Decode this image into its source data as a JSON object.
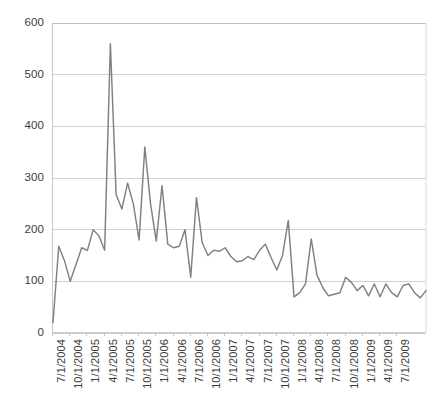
{
  "chart_data": {
    "type": "line",
    "title": "",
    "subtitle": "",
    "xlabel": "",
    "ylabel": "",
    "ylim": [
      0,
      600
    ],
    "ytick_step": 100,
    "yticks": [
      600,
      500,
      400,
      300,
      200,
      100,
      0
    ],
    "grid": true,
    "gridlines": "horizontal",
    "legend": false,
    "legend_position": "none",
    "series_color": "#808080",
    "axis_color": "#c8c8c8",
    "gridline_color": "#d0d0d0",
    "text_color": "#3b3b3b",
    "x_tick_labels": [
      "7/1/2004",
      "10/1/2004",
      "1/1/2005",
      "4/1/2005",
      "7/1/2005",
      "10/1/2005",
      "1/1/2006",
      "4/1/2006",
      "7/1/2006",
      "10/1/2006",
      "1/1/2007",
      "4/1/2007",
      "7/1/2007",
      "10/1/2007",
      "1/1/2008",
      "4/1/2008",
      "7/1/2008",
      "10/1/2008",
      "1/1/2009",
      "4/1/2009",
      "7/1/2009"
    ],
    "x_tick_interval_points": 3,
    "x_label_frequency": "quarterly",
    "point_interval": "monthly",
    "x_start": "7/1/2004",
    "x_end": "7/1/2009",
    "series": [
      {
        "name": "Series 1",
        "color": "#808080",
        "values": [
          20,
          168,
          140,
          100,
          132,
          165,
          160,
          200,
          188,
          160,
          560,
          268,
          240,
          290,
          250,
          180,
          360,
          250,
          178,
          285,
          172,
          165,
          168,
          200,
          108,
          262,
          175,
          150,
          160,
          158,
          165,
          148,
          138,
          140,
          148,
          142,
          160,
          172,
          146,
          122,
          150,
          218,
          70,
          78,
          95,
          182,
          112,
          88,
          72,
          75,
          78,
          108,
          98,
          82,
          92,
          72,
          95,
          70,
          95,
          78,
          70,
          92,
          95,
          78,
          68,
          82
        ]
      }
    ]
  },
  "figure": {
    "background": "#ffffff",
    "width": 442,
    "height": 409,
    "plot_left": 52,
    "plot_top": 23,
    "plot_width": 373,
    "plot_height": 310
  }
}
